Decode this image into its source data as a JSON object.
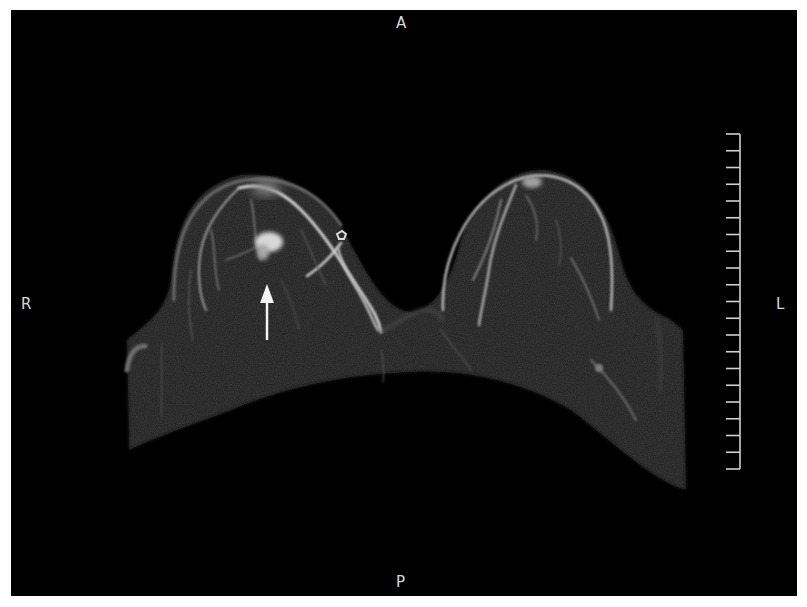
{
  "image": {
    "type": "breast MRI maximum intensity projection, axial",
    "background_color": "#000000",
    "frame_color": "#ffffff"
  },
  "orientation_labels": {
    "anterior": "A",
    "posterior": "P",
    "right": "R",
    "left": "L"
  },
  "scale_bar": {
    "tick_count": 21,
    "color": "#d0d0d0"
  },
  "annotation": {
    "kind": "arrow",
    "direction": "up",
    "color": "#f2f2f2",
    "target": "enhancing lesion in right breast"
  }
}
